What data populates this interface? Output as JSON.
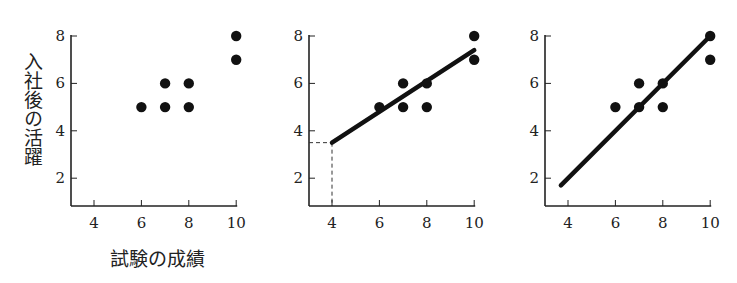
{
  "chart_data": [
    {
      "type": "scatter",
      "title": "",
      "xlabel": "試験の成績",
      "ylabel": "入社後の活躍",
      "xlim": [
        3,
        10
      ],
      "ylim": [
        1,
        8
      ],
      "xticks": [
        4,
        6,
        8,
        10
      ],
      "yticks": [
        2,
        4,
        6,
        8
      ],
      "grid": false,
      "points": [
        [
          6,
          5
        ],
        [
          7,
          5
        ],
        [
          7,
          6
        ],
        [
          8,
          5
        ],
        [
          8,
          6
        ],
        [
          10,
          7
        ],
        [
          10,
          8
        ]
      ]
    },
    {
      "type": "scatter",
      "title": "",
      "xlim": [
        3,
        10
      ],
      "ylim": [
        1,
        8
      ],
      "xticks": [
        4,
        6,
        8,
        10
      ],
      "yticks": [
        2,
        4,
        6,
        8
      ],
      "grid": false,
      "points": [
        [
          6,
          5
        ],
        [
          7,
          5
        ],
        [
          7,
          6
        ],
        [
          8,
          5
        ],
        [
          8,
          6
        ],
        [
          10,
          7
        ],
        [
          10,
          8
        ]
      ],
      "fit_line": {
        "x": [
          4,
          10
        ],
        "y": [
          3.5,
          7.4
        ]
      },
      "annotation": "dashed guide at x=4, y=3.5"
    },
    {
      "type": "scatter",
      "title": "",
      "xlim": [
        3,
        10
      ],
      "ylim": [
        1,
        8
      ],
      "xticks": [
        4,
        6,
        8,
        10
      ],
      "yticks": [
        2,
        4,
        6,
        8
      ],
      "grid": false,
      "points": [
        [
          6,
          5
        ],
        [
          7,
          5
        ],
        [
          7,
          6
        ],
        [
          8,
          5
        ],
        [
          8,
          6
        ],
        [
          10,
          7
        ],
        [
          10,
          8
        ]
      ],
      "fit_line": {
        "x": [
          3.7,
          10
        ],
        "y": [
          1.7,
          8
        ]
      }
    }
  ],
  "labels": {
    "ylabel": "入社後の活躍",
    "xlabel": "試験の成績"
  },
  "tick_labels": {
    "x": [
      "4",
      "6",
      "8",
      "10"
    ],
    "y": [
      "2",
      "4",
      "6",
      "8"
    ]
  }
}
